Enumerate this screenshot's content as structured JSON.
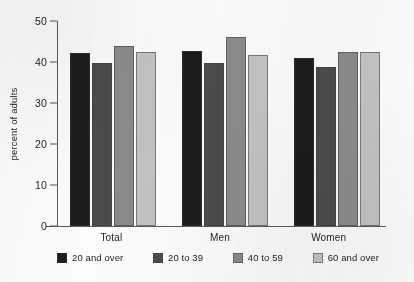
{
  "chart_data": {
    "type": "bar",
    "title": "",
    "subtitle": "",
    "xlabel": "",
    "ylabel": "percent of adults",
    "ylim": [
      0,
      50
    ],
    "yticks": [
      0,
      10,
      20,
      30,
      40,
      50
    ],
    "ytick_labels": [
      "0",
      "10",
      "20",
      "30",
      "40",
      "50"
    ],
    "grid": false,
    "legend_position": "bottom",
    "categories": [
      "Total",
      "Men",
      "Women"
    ],
    "series": [
      {
        "name": "20 and over",
        "color": "#1c1c1c",
        "values": [
          42.3,
          42.6,
          41.0
        ]
      },
      {
        "name": "20 to 39",
        "color": "#4c4c4c",
        "values": [
          39.8,
          39.8,
          38.8
        ]
      },
      {
        "name": "40 to 59",
        "color": "#8b8b8b",
        "values": [
          44.0,
          46.1,
          42.5
        ]
      },
      {
        "name": "60 and over",
        "color": "#c2c2c2",
        "values": [
          42.5,
          41.6,
          42.5
        ]
      }
    ]
  },
  "legend": {
    "items": [
      {
        "label": "20 and over"
      },
      {
        "label": "20 to 39"
      },
      {
        "label": "40 to 59"
      },
      {
        "label": "60 and over"
      }
    ]
  }
}
